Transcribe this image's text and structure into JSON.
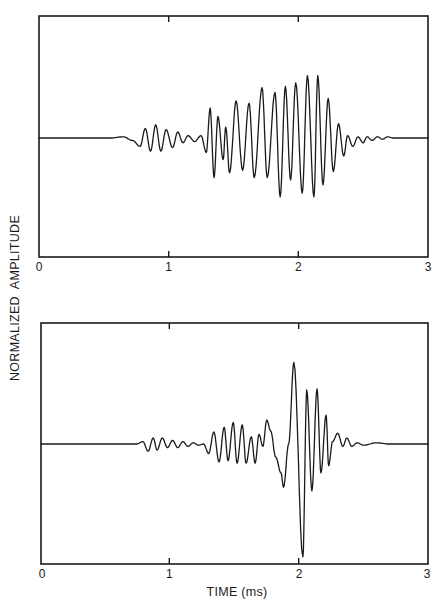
{
  "figure": {
    "ylabel": "NORMALIZED  AMPLITUDE",
    "xlabel": "TIME (ms)"
  },
  "chart_data": [
    {
      "type": "line",
      "title": "",
      "panel": "top",
      "xlabel": "",
      "ylabel": "NORMALIZED AMPLITUDE",
      "xlim": [
        0,
        3
      ],
      "ylim": [
        -1,
        1
      ],
      "x_ticks": [
        "0",
        "1",
        "2",
        "3"
      ],
      "y_ticks": [],
      "grid": false,
      "legend": null,
      "description": "Gradually building wave packet: small precursor oscillations 0.75-1.3 ms, then large symmetric burst peaking near 2.15 ms, decaying to zero by ~2.8 ms",
      "series": [
        {
          "name": "signal",
          "x": [
            0.0,
            0.55,
            0.65,
            0.72,
            0.78,
            0.82,
            0.86,
            0.9,
            0.94,
            0.98,
            1.03,
            1.07,
            1.11,
            1.15,
            1.2,
            1.25,
            1.29,
            1.32,
            1.35,
            1.38,
            1.42,
            1.44,
            1.47,
            1.52,
            1.57,
            1.62,
            1.66,
            1.72,
            1.76,
            1.82,
            1.86,
            1.9,
            1.94,
            1.98,
            2.03,
            2.07,
            2.12,
            2.15,
            2.19,
            2.23,
            2.27,
            2.31,
            2.35,
            2.38,
            2.42,
            2.46,
            2.5,
            2.53,
            2.57,
            2.61,
            2.65,
            2.69,
            2.73,
            2.77,
            2.8,
            3.0
          ],
          "y": [
            0.0,
            0.0,
            0.01,
            -0.02,
            -0.07,
            0.08,
            -0.11,
            0.11,
            -0.11,
            0.07,
            -0.08,
            0.05,
            -0.04,
            0.02,
            -0.03,
            0.02,
            -0.12,
            0.25,
            -0.33,
            0.18,
            -0.18,
            0.09,
            -0.29,
            0.31,
            -0.27,
            0.29,
            -0.33,
            0.42,
            -0.33,
            0.38,
            -0.49,
            0.43,
            -0.35,
            0.46,
            -0.46,
            0.52,
            -0.49,
            0.52,
            -0.39,
            0.33,
            -0.28,
            0.12,
            -0.15,
            0.02,
            -0.07,
            0.01,
            -0.04,
            0.01,
            -0.02,
            0.01,
            -0.01,
            0.01,
            0.0,
            0.0,
            0.0,
            0.0
          ]
        }
      ]
    },
    {
      "type": "line",
      "title": "",
      "panel": "bottom",
      "xlabel": "TIME (ms)",
      "ylabel": "NORMALIZED AMPLITUDE",
      "xlim": [
        0,
        3
      ],
      "ylim": [
        -1,
        1
      ],
      "x_ticks": [
        "0",
        "1",
        "2",
        "3"
      ],
      "y_ticks": [],
      "grid": false,
      "legend": null,
      "description": "Dispersed signal with small ripples 0.75-1.25 ms, moderate burst 1.3-1.8 ms, then dominant compressed pulse: large positive peak ~1.97 ms followed by deepest negative trough ~2.03 ms, ringing out by ~2.5 ms",
      "series": [
        {
          "name": "signal",
          "x": [
            0.0,
            0.74,
            0.79,
            0.83,
            0.87,
            0.9,
            0.94,
            0.98,
            1.02,
            1.06,
            1.1,
            1.14,
            1.18,
            1.22,
            1.26,
            1.3,
            1.34,
            1.38,
            1.42,
            1.45,
            1.49,
            1.52,
            1.56,
            1.59,
            1.63,
            1.66,
            1.69,
            1.72,
            1.75,
            1.78,
            1.82,
            1.86,
            1.88,
            1.92,
            1.96,
            2.03,
            2.06,
            2.1,
            2.14,
            2.17,
            2.21,
            2.23,
            2.26,
            2.3,
            2.34,
            2.37,
            2.41,
            2.45,
            2.5,
            2.6,
            2.7,
            3.0
          ],
          "y": [
            0.0,
            0.0,
            0.02,
            -0.06,
            0.05,
            -0.05,
            0.05,
            -0.03,
            0.03,
            -0.03,
            0.02,
            -0.02,
            0.01,
            -0.01,
            0.0,
            -0.08,
            0.1,
            -0.15,
            0.14,
            -0.14,
            0.18,
            -0.16,
            0.16,
            -0.16,
            0.06,
            -0.16,
            0.08,
            -0.02,
            0.2,
            0.11,
            -0.11,
            -0.24,
            -0.36,
            0.0,
            0.68,
            -0.94,
            0.45,
            -0.39,
            0.46,
            -0.24,
            0.24,
            -0.18,
            0.02,
            0.09,
            -0.02,
            0.05,
            -0.02,
            0.01,
            -0.01,
            0.01,
            0.0,
            0.0
          ]
        }
      ]
    }
  ]
}
